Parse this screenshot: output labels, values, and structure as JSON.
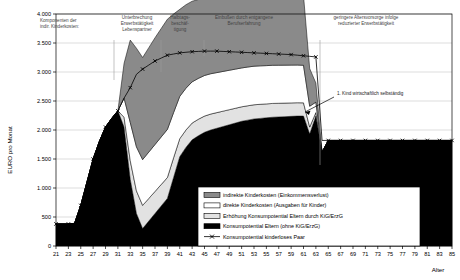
{
  "chart_data": {
    "type": "area",
    "title": "",
    "xlabel": "Alter",
    "ylabel": "EURO pro Monat",
    "xlim": [
      21,
      85
    ],
    "ylim": [
      0,
      4000
    ],
    "ytick_step": 500,
    "ytick_labels": [
      "0",
      "500",
      "1.000",
      "1.500",
      "2.000",
      "2.500",
      "3.000",
      "3.500",
      "4.000"
    ],
    "ytick_values": [
      0,
      500,
      1000,
      1500,
      2000,
      2500,
      3000,
      3500,
      4000
    ],
    "xtick_labels": [
      "21",
      "23",
      "25",
      "27",
      "29",
      "31",
      "33",
      "35",
      "37",
      "39",
      "41",
      "43",
      "45",
      "47",
      "49",
      "51",
      "53",
      "55",
      "57",
      "59",
      "61",
      "63",
      "65",
      "67",
      "69",
      "71",
      "73",
      "75",
      "77",
      "79",
      "81",
      "83",
      "85"
    ],
    "xtick_values": [
      21,
      23,
      25,
      27,
      29,
      31,
      33,
      35,
      37,
      39,
      41,
      43,
      45,
      47,
      49,
      51,
      53,
      55,
      57,
      59,
      61,
      63,
      65,
      67,
      69,
      71,
      73,
      75,
      77,
      79,
      81,
      83,
      85
    ],
    "grid": true,
    "legend_position": "bottom-right",
    "x": [
      21,
      22,
      23,
      24,
      25,
      26,
      27,
      28,
      29,
      30,
      31,
      32,
      33,
      34,
      35,
      36,
      37,
      38,
      39,
      40,
      41,
      42,
      43,
      44,
      45,
      46,
      47,
      48,
      49,
      50,
      51,
      52,
      53,
      54,
      55,
      56,
      57,
      58,
      59,
      60,
      61,
      62,
      63,
      64,
      65,
      66,
      67,
      68,
      69,
      70,
      71,
      72,
      73,
      74,
      75,
      76,
      77,
      78,
      79,
      80,
      81,
      82,
      83,
      84,
      85
    ],
    "series": [
      {
        "name": "Konsumpotential Eltern (ohne KiG/ErzG)",
        "key": "konsum_eltern",
        "fill": "#000000",
        "values": [
          380,
          380,
          380,
          390,
          700,
          1100,
          1500,
          1800,
          2050,
          2200,
          2330,
          2050,
          1150,
          560,
          300,
          430,
          560,
          690,
          820,
          1180,
          1540,
          1700,
          1830,
          1900,
          1960,
          2000,
          2030,
          2060,
          2090,
          2120,
          2150,
          2170,
          2190,
          2200,
          2210,
          2220,
          2225,
          2230,
          2235,
          2240,
          2240,
          1930,
          2240,
          1620,
          1820,
          1820,
          1820,
          1820,
          1820,
          1820,
          1820,
          1820,
          1820,
          1820,
          1820,
          1820,
          1820,
          1820,
          1820,
          1820,
          1820,
          1820,
          1820,
          1820,
          1820
        ]
      },
      {
        "name": "Erhöhung Konsumpotential Eltern durch KiG/ErzG",
        "key": "erhoehung_kig",
        "fill": "#e2e2e2",
        "values": [
          0,
          0,
          0,
          0,
          0,
          0,
          0,
          0,
          0,
          0,
          0,
          170,
          320,
          390,
          400,
          390,
          380,
          370,
          360,
          340,
          310,
          300,
          290,
          285,
          280,
          275,
          270,
          265,
          260,
          255,
          250,
          248,
          245,
          243,
          240,
          238,
          236,
          234,
          232,
          230,
          228,
          120,
          60,
          0,
          0,
          0,
          0,
          0,
          0,
          0,
          0,
          0,
          0,
          0,
          0,
          0,
          0,
          0,
          0,
          0,
          0,
          0,
          0,
          0,
          0
        ]
      },
      {
        "name": "direkte Kinderkosten (Ausgaben für Kinder)",
        "key": "direkte_kinderkosten",
        "fill": "#ffffff",
        "values": [
          0,
          0,
          0,
          0,
          0,
          0,
          0,
          0,
          0,
          0,
          0,
          330,
          660,
          760,
          790,
          800,
          810,
          820,
          830,
          780,
          730,
          720,
          710,
          705,
          700,
          695,
          690,
          685,
          680,
          675,
          670,
          668,
          665,
          663,
          660,
          658,
          656,
          654,
          652,
          650,
          648,
          360,
          180,
          0,
          0,
          0,
          0,
          0,
          0,
          0,
          0,
          0,
          0,
          0,
          0,
          0,
          0,
          0,
          0,
          0,
          0,
          0,
          0,
          0,
          0
        ]
      },
      {
        "name": "indirekte Kinderkosten (Einkommensverlust)",
        "key": "indirekte_kinderkosten",
        "fill": "#8a8a8a",
        "values": [
          0,
          0,
          0,
          0,
          0,
          0,
          0,
          0,
          0,
          0,
          0,
          600,
          1420,
          1700,
          1760,
          1800,
          1840,
          1870,
          1900,
          1700,
          1500,
          1440,
          1390,
          1360,
          1340,
          1320,
          1300,
          1290,
          1280,
          1270,
          1260,
          1250,
          1245,
          1240,
          1235,
          1230,
          1225,
          1220,
          1215,
          1210,
          1205,
          650,
          330,
          0,
          0,
          0,
          0,
          0,
          0,
          0,
          0,
          0,
          0,
          0,
          0,
          0,
          0,
          0,
          0,
          0,
          0,
          0,
          0,
          0,
          0
        ]
      }
    ],
    "reference_line": {
      "name": "Konsumpotential kinderloses Paar",
      "key": "kinderloses_paar",
      "marker": "x",
      "values": [
        380,
        380,
        380,
        390,
        700,
        1100,
        1500,
        1800,
        2050,
        2200,
        2330,
        2550,
        2730,
        2960,
        3050,
        3120,
        3190,
        3240,
        3290,
        3310,
        3330,
        3340,
        3350,
        3355,
        3360,
        3360,
        3360,
        3355,
        3350,
        3345,
        3340,
        3335,
        3330,
        3325,
        3320,
        3315,
        3310,
        3305,
        3300,
        3290,
        3280,
        3270,
        3260,
        1820,
        1820,
        1820,
        1820,
        1820,
        1820,
        1820,
        1820,
        1820,
        1820,
        1820,
        1820,
        1820,
        1820,
        1820,
        1820,
        1820,
        1820,
        1820,
        1820,
        1820,
        1820
      ]
    },
    "annotations": [
      {
        "key": "a0",
        "text_lines": [
          "Komponenten der",
          "indir. Kinderkosten:"
        ],
        "x_px": 40,
        "y_px": 22,
        "align": "start",
        "line": false
      },
      {
        "key": "a1",
        "text_lines": [
          "Unterbrechung",
          "Erwerbstätigkeit",
          "Lebenspartner"
        ],
        "x_px": 137,
        "y_px": 19,
        "align": "middle",
        "line": true,
        "line_x_px": 114,
        "line_y1_px": 40,
        "line_y2_px": 80
      },
      {
        "key": "a2",
        "text_lines": [
          "Halbtags-",
          "beschäf-",
          "tigung"
        ],
        "x_px": 180,
        "y_px": 19,
        "align": "middle",
        "line": true,
        "line_x_px": 161,
        "line_y1_px": 40,
        "line_y2_px": 72
      },
      {
        "key": "a3",
        "text_lines": [
          "Einbußen durch entgangene",
          "Berufserfahrung"
        ],
        "x_px": 244,
        "y_px": 19,
        "align": "middle",
        "line": true,
        "line_x_px": 204,
        "line_y1_px": 40,
        "line_y2_px": 56
      },
      {
        "key": "a4",
        "text_lines": [
          "geringere Altersvorsorge infolge",
          "reduzierter Erwerbstätigkeit"
        ],
        "x_px": 366,
        "y_px": 19,
        "align": "middle",
        "line": true,
        "line_x_px": 320,
        "line_y1_px": 40,
        "line_y2_px": 165
      }
    ],
    "callout": {
      "key": "c1",
      "text": "1. Kind wirtschaftlich selbständig",
      "x_px": 337,
      "y_px": 95,
      "arrow_from_x_px": 334,
      "arrow_from_y_px": 97,
      "arrow_to_x_px": 305,
      "arrow_to_y_px": 112
    }
  }
}
